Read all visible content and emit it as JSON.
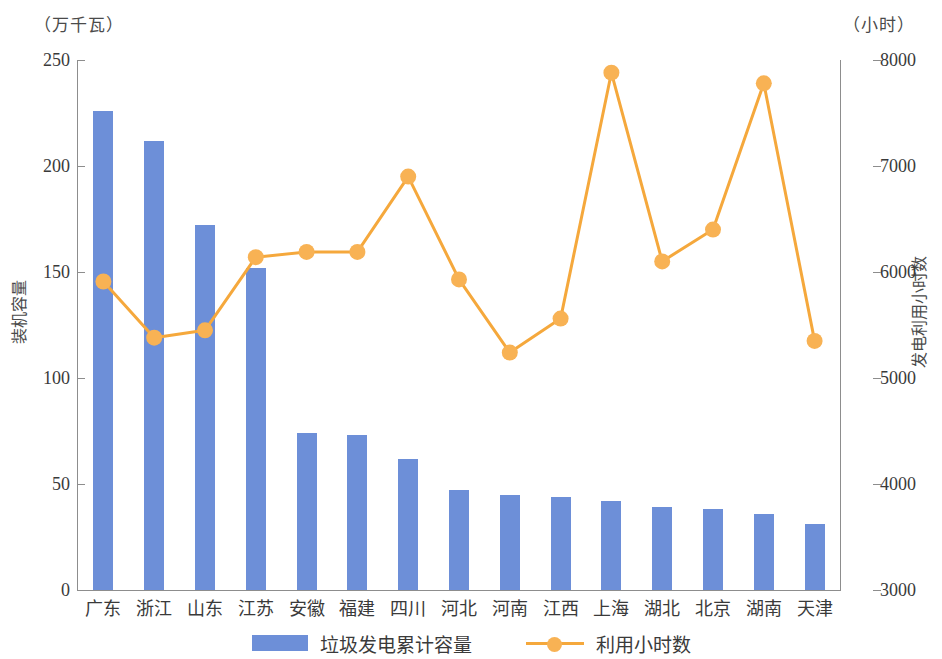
{
  "chart_data": {
    "type": "bar",
    "title": "",
    "subtitle": "",
    "categories": [
      "广东",
      "浙江",
      "山东",
      "江苏",
      "安徽",
      "福建",
      "四川",
      "河北",
      "河南",
      "江西",
      "上海",
      "湖北",
      "北京",
      "湖南",
      "天津"
    ],
    "series": [
      {
        "name": "垃圾发电累计容量",
        "type": "bar",
        "axis": "left",
        "unit": "万千瓦",
        "color": "#6d8fd8",
        "values": [
          226,
          212,
          172,
          152,
          74,
          73,
          62,
          47,
          45,
          44,
          42,
          39,
          38,
          36,
          31
        ]
      },
      {
        "name": "利用小时数",
        "type": "line",
        "axis": "right",
        "unit": "小时",
        "color": "#f5a83c",
        "values": [
          5910,
          5380,
          5450,
          6140,
          6190,
          6190,
          6900,
          5930,
          5240,
          5560,
          7880,
          6100,
          6400,
          7780,
          5350
        ]
      }
    ],
    "left_axis": {
      "label": "装机容量",
      "unit_label": "（万千瓦）",
      "min": 0,
      "max": 250,
      "step": 50,
      "ticks": [
        "0",
        "50",
        "100",
        "150",
        "200",
        "250"
      ]
    },
    "right_axis": {
      "label": "发电利用小时数",
      "unit_label": "（小时）",
      "min": 3000,
      "max": 8000,
      "step": 1000,
      "ticks": [
        "3000",
        "4000",
        "5000",
        "6000",
        "7000",
        "8000"
      ]
    },
    "xlabel": "",
    "grid": false,
    "legend_position": "bottom",
    "legend": [
      {
        "label": "垃圾发电累计容量",
        "marker": "bar-swatch",
        "color": "#6d8fd8"
      },
      {
        "label": "利用小时数",
        "marker": "line-dot-swatch",
        "color": "#f5a83c"
      }
    ]
  }
}
